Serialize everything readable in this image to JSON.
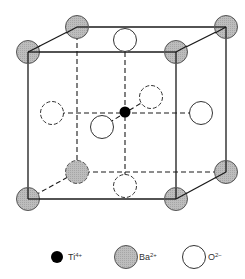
{
  "diagram": {
    "colors": {
      "line": "#1a1a1a",
      "ba_fill": "#b8b8b8",
      "ti_fill": "#000000",
      "o_fill": "#ffffff"
    },
    "legend": [
      {
        "ion": "Ti",
        "charge": "4+",
        "icon": "black-filled-circle"
      },
      {
        "ion": "Ba",
        "charge": "2+",
        "icon": "gray-hatched-circle"
      },
      {
        "ion": "O",
        "charge": "2−",
        "icon": "white-open-circle"
      }
    ]
  }
}
